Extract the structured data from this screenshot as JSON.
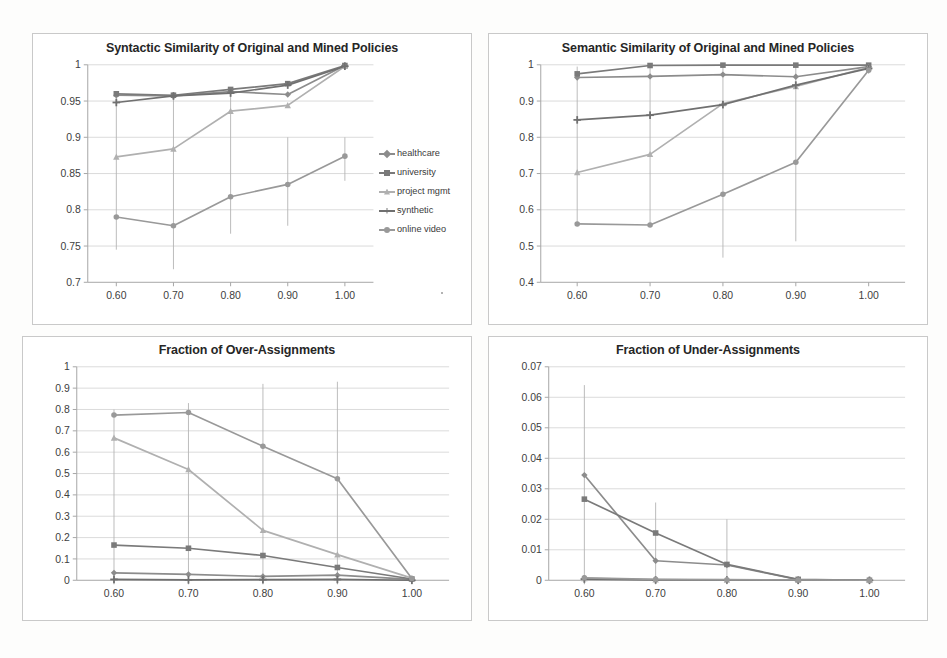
{
  "page": {
    "background": "#fdfdfc",
    "grid_color": "#c9c9c9",
    "axis_color": "#a6a6a6",
    "text_color": "#404040"
  },
  "legend": {
    "position": "right",
    "items": [
      {
        "label": "healthcare",
        "color": "#8c8c8c",
        "marker": "diamond"
      },
      {
        "label": "university",
        "color": "#7a7a7a",
        "marker": "square"
      },
      {
        "label": "project mgmt",
        "color": "#b0b0b0",
        "marker": "triangle"
      },
      {
        "label": "synthetic",
        "color": "#707070",
        "marker": "cross"
      },
      {
        "label": "online video",
        "color": "#999999",
        "marker": "circle"
      }
    ]
  },
  "chart_data": [
    {
      "id": "syntactic",
      "type": "line",
      "title": "Syntactic Similarity of Original and Mined Policies",
      "xlabel": "",
      "ylabel": "",
      "x": [
        0.6,
        0.7,
        0.8,
        0.9,
        1.0
      ],
      "xticklabels": [
        "0.60",
        "0.70",
        "0.80",
        "0.90",
        "1.00"
      ],
      "yticks": [
        0.7,
        0.75,
        0.8,
        0.85,
        0.9,
        0.95,
        1
      ],
      "yticklabels": [
        "0.7",
        "0.75",
        "0.8",
        "0.85",
        "0.9",
        "0.95",
        "1"
      ],
      "xlim": [
        0.55,
        1.05
      ],
      "ylim": [
        0.7,
        1.0
      ],
      "grid": true,
      "legend": true,
      "series": [
        {
          "name": "healthcare",
          "color": "#8c8c8c",
          "values": [
            0.958,
            0.957,
            0.963,
            0.959,
            0.999
          ]
        },
        {
          "name": "university",
          "color": "#7a7a7a",
          "values": [
            0.96,
            0.958,
            0.966,
            0.974,
            0.999
          ]
        },
        {
          "name": "project mgmt",
          "color": "#b0b0b0",
          "values": [
            0.873,
            0.884,
            0.936,
            0.944,
            0.998
          ]
        },
        {
          "name": "synthetic",
          "color": "#707070",
          "values": [
            0.948,
            0.957,
            0.961,
            0.972,
            0.998
          ]
        },
        {
          "name": "online video",
          "color": "#999999",
          "values": [
            0.79,
            0.778,
            0.818,
            0.835,
            0.874
          ]
        }
      ],
      "errorbars": [
        {
          "x": 0.6,
          "low": 0.745,
          "high": 0.962
        },
        {
          "x": 0.7,
          "low": 0.718,
          "high": 0.959
        },
        {
          "x": 0.8,
          "low": 0.767,
          "high": 0.966
        },
        {
          "x": 0.9,
          "low": 0.778,
          "high": 0.9
        },
        {
          "x": 1.0,
          "low": 0.84,
          "high": 0.9
        }
      ]
    },
    {
      "id": "semantic",
      "type": "line",
      "title": "Semantic Similarity of Original and Mined Policies",
      "xlabel": "",
      "ylabel": "",
      "x": [
        0.6,
        0.7,
        0.8,
        0.9,
        1.0
      ],
      "xticklabels": [
        "0.60",
        "0.70",
        "0.80",
        "0.90",
        "1.00"
      ],
      "yticks": [
        0.4,
        0.5,
        0.6,
        0.7,
        0.8,
        0.9,
        1
      ],
      "yticklabels": [
        "0.4",
        "0.5",
        "0.6",
        "0.7",
        "0.8",
        "0.9",
        "1"
      ],
      "xlim": [
        0.55,
        1.05
      ],
      "ylim": [
        0.4,
        1.0
      ],
      "grid": true,
      "legend": false,
      "series": [
        {
          "name": "healthcare",
          "color": "#8c8c8c",
          "values": [
            0.965,
            0.968,
            0.973,
            0.967,
            0.995
          ]
        },
        {
          "name": "university",
          "color": "#7a7a7a",
          "values": [
            0.975,
            0.998,
            0.999,
            0.999,
            0.999
          ]
        },
        {
          "name": "project mgmt",
          "color": "#b0b0b0",
          "values": [
            0.703,
            0.753,
            0.893,
            0.94,
            0.993
          ]
        },
        {
          "name": "synthetic",
          "color": "#707070",
          "values": [
            0.848,
            0.861,
            0.89,
            0.944,
            0.99
          ]
        },
        {
          "name": "online video",
          "color": "#999999",
          "values": [
            0.561,
            0.558,
            0.643,
            0.731,
            0.985
          ]
        }
      ],
      "errorbars": [
        {
          "x": 0.6,
          "low": 0.555,
          "high": 0.995
        },
        {
          "x": 0.7,
          "low": 0.56,
          "high": 0.998
        },
        {
          "x": 0.8,
          "low": 0.468,
          "high": 0.998
        },
        {
          "x": 0.9,
          "low": 0.513,
          "high": 0.998
        },
        {
          "x": 1.0,
          "low": 0.975,
          "high": 0.999
        }
      ]
    },
    {
      "id": "over-assignments",
      "type": "line",
      "title": "Fraction of Over-Assignments",
      "xlabel": "",
      "ylabel": "",
      "x": [
        0.6,
        0.7,
        0.8,
        0.9,
        1.0
      ],
      "xticklabels": [
        "0.60",
        "0.70",
        "0.80",
        "0.90",
        "1.00"
      ],
      "yticks": [
        0,
        0.1,
        0.2,
        0.3,
        0.4,
        0.5,
        0.6,
        0.7,
        0.8,
        0.9,
        1
      ],
      "yticklabels": [
        "0",
        "0.1",
        "0.2",
        "0.3",
        "0.4",
        "0.5",
        "0.6",
        "0.7",
        "0.8",
        "0.9",
        "1"
      ],
      "xlim": [
        0.55,
        1.05
      ],
      "ylim": [
        0,
        1.0
      ],
      "grid": true,
      "legend": false,
      "series": [
        {
          "name": "healthcare",
          "color": "#8c8c8c",
          "values": [
            0.035,
            0.028,
            0.018,
            0.024,
            0.004
          ]
        },
        {
          "name": "university",
          "color": "#7a7a7a",
          "values": [
            0.165,
            0.15,
            0.116,
            0.06,
            0.006
          ]
        },
        {
          "name": "project mgmt",
          "color": "#b0b0b0",
          "values": [
            0.667,
            0.519,
            0.234,
            0.12,
            0.01
          ]
        },
        {
          "name": "synthetic",
          "color": "#707070",
          "values": [
            0.004,
            0.002,
            0.003,
            0.004,
            0.0
          ]
        },
        {
          "name": "online video",
          "color": "#999999",
          "values": [
            0.774,
            0.786,
            0.628,
            0.476,
            0.008
          ]
        }
      ],
      "errorbars": [
        {
          "x": 0.6,
          "low": 0.0,
          "high": 0.8
        },
        {
          "x": 0.7,
          "low": 0.0,
          "high": 0.83
        },
        {
          "x": 0.8,
          "low": 0.0,
          "high": 0.92
        },
        {
          "x": 0.9,
          "low": 0.0,
          "high": 0.93
        },
        {
          "x": 1.0,
          "low": 0.0,
          "high": 0.02
        }
      ]
    },
    {
      "id": "under-assignments",
      "type": "line",
      "title": "Fraction of Under-Assignments",
      "xlabel": "",
      "ylabel": "",
      "x": [
        0.6,
        0.7,
        0.8,
        0.9,
        1.0
      ],
      "xticklabels": [
        "0.60",
        "0.70",
        "0.80",
        "0.90",
        "1.00"
      ],
      "yticks": [
        0,
        0.01,
        0.02,
        0.03,
        0.04,
        0.05,
        0.06,
        0.07
      ],
      "yticklabels": [
        "0",
        "0.01",
        "0.02",
        "0.03",
        "0.04",
        "0.05",
        "0.06",
        "0.07"
      ],
      "xlim": [
        0.55,
        1.05
      ],
      "ylim": [
        0,
        0.07
      ],
      "grid": true,
      "legend": false,
      "series": [
        {
          "name": "healthcare",
          "color": "#8c8c8c",
          "values": [
            0.0345,
            0.0064,
            0.005,
            0.0002,
            0.0
          ]
        },
        {
          "name": "university",
          "color": "#7a7a7a",
          "values": [
            0.0266,
            0.0155,
            0.0052,
            0.0003,
            0.0
          ]
        },
        {
          "name": "project mgmt",
          "color": "#b0b0b0",
          "values": [
            0.0006,
            0.0002,
            0.0001,
            0.0,
            0.0
          ]
        },
        {
          "name": "synthetic",
          "color": "#707070",
          "values": [
            0.0004,
            0.0001,
            0.0001,
            0.0,
            0.0
          ]
        },
        {
          "name": "online video",
          "color": "#999999",
          "values": [
            0.0008,
            0.0003,
            0.0002,
            0.0001,
            0.0
          ]
        }
      ],
      "errorbars": [
        {
          "x": 0.6,
          "low": 0.0,
          "high": 0.064
        },
        {
          "x": 0.7,
          "low": 0.0,
          "high": 0.0255
        },
        {
          "x": 0.8,
          "low": 0.0,
          "high": 0.02
        },
        {
          "x": 0.9,
          "low": 0.0,
          "high": 0.0002
        },
        {
          "x": 1.0,
          "low": 0.0,
          "high": 0.0001
        }
      ]
    }
  ]
}
